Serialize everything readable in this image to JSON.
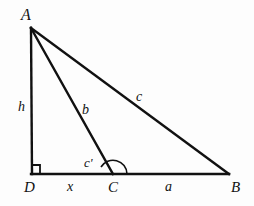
{
  "figure": {
    "kind": "geometry-diagram",
    "background_color": "#fdfdfd",
    "stroke_color": "#111111",
    "stroke_width": 2,
    "canvas": {
      "width": 254,
      "height": 206
    }
  },
  "vertices": [
    {
      "id": "A",
      "label": "A",
      "x": 31,
      "y": 28
    },
    {
      "id": "D",
      "label": "D",
      "x": 32,
      "y": 174
    },
    {
      "id": "C",
      "label": "C",
      "x": 113,
      "y": 174
    },
    {
      "id": "B",
      "label": "B",
      "x": 229,
      "y": 174
    }
  ],
  "segments": [
    {
      "id": "AD",
      "from": "A",
      "to": "D",
      "label": "h"
    },
    {
      "id": "AC",
      "from": "A",
      "to": "C",
      "label": "b"
    },
    {
      "id": "AB",
      "from": "A",
      "to": "B",
      "label": "c"
    },
    {
      "id": "DC",
      "from": "D",
      "to": "C",
      "label": "x"
    },
    {
      "id": "CB",
      "from": "C",
      "to": "B",
      "label": "a"
    }
  ],
  "segment_labels": {
    "altitude": "h",
    "cevian": "b",
    "hypotenuse": "c",
    "base_left": "x",
    "base_right": "a",
    "angle_at_C": "c'"
  },
  "angle_markers": [
    {
      "id": "right-angle-D",
      "at": "D",
      "type": "right-angle-square",
      "size": 8
    },
    {
      "id": "angle-C",
      "at": "C",
      "type": "arc",
      "label": "c'",
      "radius": 14
    }
  ]
}
